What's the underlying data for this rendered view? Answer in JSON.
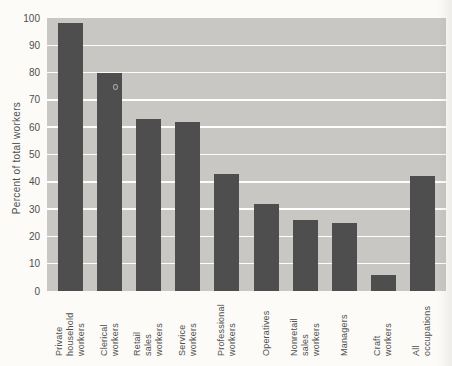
{
  "figure": {
    "page_background": "#fcfbf8",
    "plot_background": "#c8c7c4",
    "bar_color": "#4e4e4e",
    "gridline_color": "#fdfdfd",
    "text_color": "#4f4f4f"
  },
  "chart_data": {
    "type": "bar",
    "title": "",
    "xlabel": "",
    "ylabel": "Percent of total workers",
    "ylim": [
      0,
      100
    ],
    "y_ticks": [
      0,
      10,
      20,
      30,
      40,
      50,
      60,
      70,
      80,
      90,
      100
    ],
    "grid": true,
    "legend": false,
    "categories": [
      "Private\nhousehold\nworkers",
      "Clerical\nworkers",
      "Retail\nsales\nworkers",
      "Service\nworkers",
      "Professional\nworkers",
      "Operatives",
      "Nonretail\nsales\nworkers",
      "Managers",
      "Craft\nworkers",
      "All\noccupations"
    ],
    "values": [
      98,
      80,
      63,
      62,
      43,
      32,
      26,
      25,
      6,
      42
    ]
  }
}
